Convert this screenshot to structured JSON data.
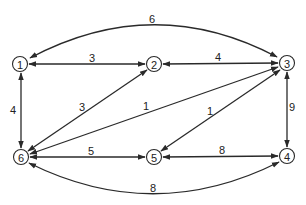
{
  "diagram": {
    "type": "undirected-weighted-graph",
    "colors": {
      "stroke": "#2a2a2a",
      "background": "#ffffff",
      "text": "#222222"
    },
    "nodes": [
      {
        "id": "1",
        "label": "1",
        "x": 20,
        "y": 64
      },
      {
        "id": "2",
        "label": "2",
        "x": 154,
        "y": 64
      },
      {
        "id": "3",
        "label": "3",
        "x": 287,
        "y": 63
      },
      {
        "id": "4",
        "label": "4",
        "x": 287,
        "y": 156
      },
      {
        "id": "5",
        "label": "5",
        "x": 154,
        "y": 157
      },
      {
        "id": "6",
        "label": "6",
        "x": 21,
        "y": 157
      }
    ],
    "edges": [
      {
        "from": "1",
        "to": "3",
        "weight": "6",
        "curve": "top"
      },
      {
        "from": "1",
        "to": "2",
        "weight": "3"
      },
      {
        "from": "2",
        "to": "3",
        "weight": "4"
      },
      {
        "from": "1",
        "to": "6",
        "weight": "4"
      },
      {
        "from": "3",
        "to": "4",
        "weight": "9"
      },
      {
        "from": "6",
        "to": "2",
        "weight": "3"
      },
      {
        "from": "6",
        "to": "3",
        "weight": "1"
      },
      {
        "from": "5",
        "to": "3",
        "weight": "1"
      },
      {
        "from": "6",
        "to": "5",
        "weight": "5"
      },
      {
        "from": "5",
        "to": "4",
        "weight": "8"
      },
      {
        "from": "6",
        "to": "4",
        "weight": "8",
        "curve": "bottom"
      }
    ]
  }
}
